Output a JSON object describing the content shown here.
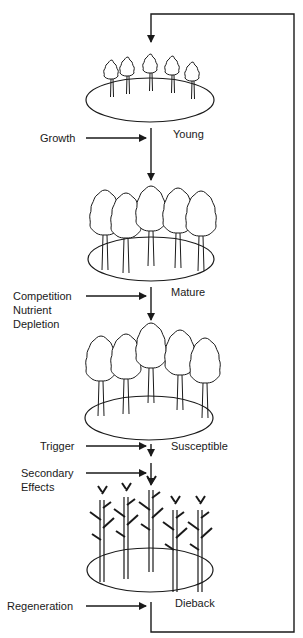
{
  "diagram": {
    "stages": [
      {
        "label": "Young",
        "tree_type": "young"
      },
      {
        "label": "Mature",
        "tree_type": "mature"
      },
      {
        "label": "Susceptible",
        "tree_type": "susceptible"
      },
      {
        "label": "Dieback",
        "tree_type": "dead"
      }
    ],
    "inputs": [
      {
        "label": "Growth"
      },
      {
        "label": "Competition"
      },
      {
        "label": "Nutrient"
      },
      {
        "label": "Depletion"
      },
      {
        "label": "Trigger"
      },
      {
        "label": "Secondary"
      },
      {
        "label": "Effects"
      },
      {
        "label": "Regeneration"
      }
    ],
    "colors": {
      "line": "#1a1a1a",
      "background": "#ffffff"
    }
  }
}
